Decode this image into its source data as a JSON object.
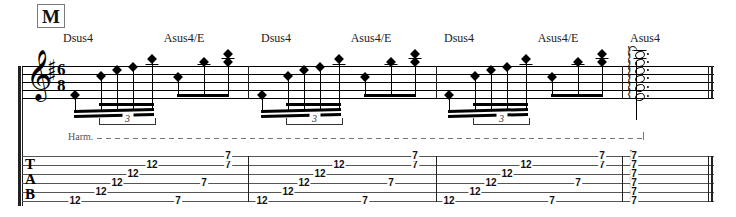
{
  "score": {
    "rehearsal_mark": "M",
    "clef": "treble-clef",
    "key_signature": {
      "accidental": "sharp",
      "count": 2,
      "glyph": "♯"
    },
    "time_signature": {
      "numerator": "6",
      "denominator": "8"
    },
    "technique_label": "Harm.",
    "tab_letters": [
      "T",
      "A",
      "B"
    ],
    "triplet_label": "3",
    "chords": [
      {
        "label": "Dsus4",
        "x": 78
      },
      {
        "label": "Asus4/E",
        "x": 184
      },
      {
        "label": "Dsus4",
        "x": 276
      },
      {
        "label": "Asus4/E",
        "x": 371
      },
      {
        "label": "Dsus4",
        "x": 459
      },
      {
        "label": "Asus4/E",
        "x": 558
      },
      {
        "label": "Asus4",
        "x": 645
      }
    ],
    "barlines": [
      248,
      436,
      622,
      712
    ],
    "measures": [
      {
        "index": 1,
        "tab_notes": [
          {
            "fret": "12",
            "string": 6,
            "x": 75
          },
          {
            "fret": "12",
            "string": 5,
            "x": 101
          },
          {
            "fret": "12",
            "string": 4,
            "x": 117
          },
          {
            "fret": "12",
            "string": 3,
            "x": 133
          },
          {
            "fret": "12",
            "string": 2,
            "x": 152
          },
          {
            "fret": "7",
            "string": 6,
            "x": 178
          },
          {
            "fret": "7",
            "string": 4,
            "x": 204
          },
          {
            "fret": "7",
            "string": 2,
            "x": 228
          },
          {
            "fret": "7",
            "string": 1,
            "x": 228
          }
        ]
      },
      {
        "index": 2,
        "tab_notes": [
          {
            "fret": "12",
            "string": 6,
            "x": 262
          },
          {
            "fret": "12",
            "string": 5,
            "x": 288
          },
          {
            "fret": "12",
            "string": 4,
            "x": 304
          },
          {
            "fret": "12",
            "string": 3,
            "x": 320
          },
          {
            "fret": "12",
            "string": 2,
            "x": 339
          },
          {
            "fret": "7",
            "string": 6,
            "x": 365
          },
          {
            "fret": "7",
            "string": 4,
            "x": 391
          },
          {
            "fret": "7",
            "string": 2,
            "x": 415
          },
          {
            "fret": "7",
            "string": 1,
            "x": 415
          }
        ]
      },
      {
        "index": 3,
        "tab_notes": [
          {
            "fret": "12",
            "string": 6,
            "x": 449
          },
          {
            "fret": "12",
            "string": 5,
            "x": 475
          },
          {
            "fret": "12",
            "string": 4,
            "x": 491
          },
          {
            "fret": "12",
            "string": 3,
            "x": 507
          },
          {
            "fret": "12",
            "string": 2,
            "x": 526
          },
          {
            "fret": "7",
            "string": 6,
            "x": 552
          },
          {
            "fret": "7",
            "string": 4,
            "x": 578
          },
          {
            "fret": "7",
            "string": 2,
            "x": 602
          },
          {
            "fret": "7",
            "string": 1,
            "x": 602
          }
        ]
      }
    ],
    "final_chord": {
      "arpeggiated": true,
      "fermata": true,
      "frets": [
        "7",
        "7",
        "7",
        "7",
        "7",
        "7"
      ],
      "x": 634
    }
  },
  "colors": {
    "ink": "#111111",
    "staff_line": "#000000",
    "tab_line": "#555555",
    "dashed": "#777777",
    "paper": "#ffffff"
  }
}
